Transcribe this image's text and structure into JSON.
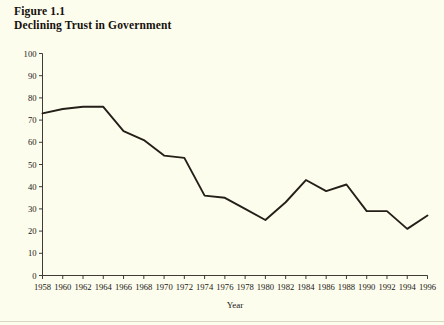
{
  "figure": {
    "label": "Figure 1.1",
    "title": "Declining Trust in Government"
  },
  "colors": {
    "background": "#fdfdee",
    "line": "#241f18",
    "axis": "#2a2520",
    "text": "#1a1612"
  },
  "chart_data": {
    "type": "line",
    "title": "Declining Trust in Government",
    "subtitle": "Figure 1.1",
    "xlabel": "Year",
    "ylabel": "",
    "xlim": [
      1958,
      1996
    ],
    "ylim": [
      0,
      100
    ],
    "grid": false,
    "legend": null,
    "x": [
      1958,
      1960,
      1962,
      1964,
      1966,
      1968,
      1970,
      1972,
      1974,
      1976,
      1978,
      1980,
      1982,
      1984,
      1986,
      1988,
      1990,
      1992,
      1994,
      1996
    ],
    "values": [
      73,
      75,
      76,
      76,
      65,
      61,
      54,
      53,
      36,
      35,
      30,
      25,
      33,
      43,
      38,
      41,
      29,
      29,
      21,
      27
    ],
    "xticks": [
      "1958",
      "1960",
      "1962",
      "1964",
      "1966",
      "1968",
      "1970",
      "1972",
      "1974",
      "1976",
      "1978",
      "1980",
      "1982",
      "1984",
      "1986",
      "1988",
      "1990",
      "1992",
      "1994",
      "1996"
    ],
    "yticks": [
      "0",
      "10",
      "20",
      "30",
      "40",
      "50",
      "60",
      "70",
      "80",
      "90",
      "100"
    ],
    "ytick_values": [
      0,
      10,
      20,
      30,
      40,
      50,
      60,
      70,
      80,
      90,
      100
    ]
  }
}
